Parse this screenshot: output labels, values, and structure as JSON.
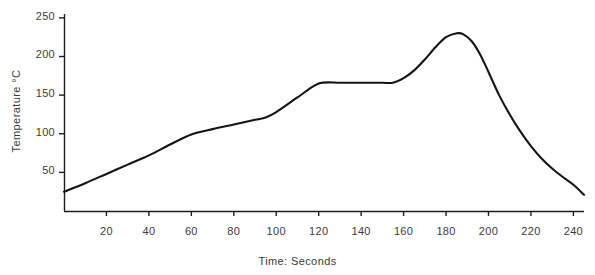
{
  "chart_data": {
    "type": "line",
    "title": "",
    "xlabel": "Time: Seconds",
    "ylabel": "Temperature °C",
    "xlim": [
      0,
      245
    ],
    "ylim": [
      0,
      255
    ],
    "grid": false,
    "legend": null,
    "xticks": [
      20,
      40,
      60,
      80,
      100,
      120,
      140,
      160,
      180,
      200,
      220,
      240
    ],
    "xtick_labels": [
      "20",
      "40",
      "60",
      "80",
      "100",
      "120",
      "140",
      "160",
      "180",
      "200",
      "220",
      "240"
    ],
    "yticks": [
      50,
      100,
      150,
      200,
      250
    ],
    "ytick_labels": [
      "50",
      "100",
      "150",
      "200",
      "250"
    ],
    "series": [
      {
        "name": "Reflow temperature profile",
        "color": "#141414",
        "x": [
          0,
          10,
          20,
          30,
          40,
          50,
          60,
          70,
          80,
          90,
          95,
          100,
          110,
          120,
          130,
          140,
          150,
          155,
          160,
          165,
          170,
          175,
          180,
          185,
          188,
          192,
          196,
          200,
          205,
          210,
          215,
          220,
          225,
          230,
          235,
          240,
          245
        ],
        "y": [
          25,
          36,
          48,
          60,
          72,
          86,
          99,
          106,
          112,
          118,
          121,
          128,
          147,
          165,
          166,
          166,
          166,
          166,
          172,
          182,
          196,
          212,
          225,
          230,
          229,
          220,
          203,
          180,
          150,
          125,
          103,
          84,
          68,
          55,
          44,
          34,
          21
        ]
      }
    ]
  },
  "axes": {
    "y_axis_title": "Temperature °C",
    "x_axis_title": "Time: Seconds"
  }
}
